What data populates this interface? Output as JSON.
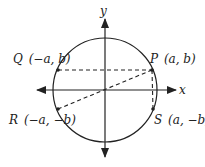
{
  "diagram": {
    "type": "unit-circle-symmetry",
    "axes": {
      "x_label": "x",
      "y_label": "y"
    },
    "points": [
      {
        "id": "P",
        "name": "P",
        "coords": "(a, b)"
      },
      {
        "id": "Q",
        "name": "Q",
        "coords": "(−a, b)"
      },
      {
        "id": "R",
        "name": "R",
        "coords": "(−a, −b)"
      },
      {
        "id": "S",
        "name": "S",
        "coords": "(a, −b)"
      }
    ],
    "colors": {
      "stroke": "#222222",
      "background": "#ffffff"
    }
  }
}
